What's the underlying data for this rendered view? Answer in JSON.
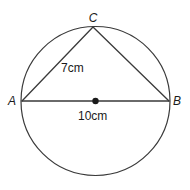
{
  "figure": {
    "type": "circle-geometry-diagram",
    "background_color": "#ffffff",
    "stroke_color": "#3a3a3a",
    "text_color": "#1a1a1a",
    "circle": {
      "center_x": 95.5,
      "center_y": 101,
      "radius": 74.5
    },
    "points": [
      {
        "name": "A",
        "label": "A",
        "x": 22,
        "y": 101,
        "label_x": 12,
        "label_y": 105
      },
      {
        "name": "B",
        "label": "B",
        "x": 169,
        "y": 101,
        "label_x": 174,
        "label_y": 105
      },
      {
        "name": "C",
        "label": "C",
        "x": 93,
        "y": 27,
        "label_x": 89,
        "label_y": 22
      },
      {
        "name": "O",
        "label": "",
        "x": 95.5,
        "y": 101,
        "label_x": 0,
        "label_y": 0
      }
    ],
    "segments": [
      {
        "name": "AC",
        "from": "A",
        "to": "C",
        "x1": 22,
        "y1": 101,
        "x2": 93,
        "y2": 27
      },
      {
        "name": "CB",
        "from": "C",
        "to": "B",
        "x1": 93,
        "y1": 27,
        "x2": 169,
        "y2": 101
      },
      {
        "name": "AB",
        "from": "A",
        "to": "B",
        "x1": 22,
        "y1": 101,
        "x2": 169,
        "y2": 101
      }
    ],
    "measurements": [
      {
        "name": "AC-length",
        "text": "7cm",
        "applies_to": "AC",
        "x": 61,
        "y": 72
      },
      {
        "name": "AB-length",
        "text": "10cm",
        "applies_to": "AB",
        "x": 78,
        "y": 120
      }
    ],
    "center_marker": {
      "name": "circle-center-dot",
      "x": 95.5,
      "y": 101,
      "radius": 3.2
    }
  }
}
